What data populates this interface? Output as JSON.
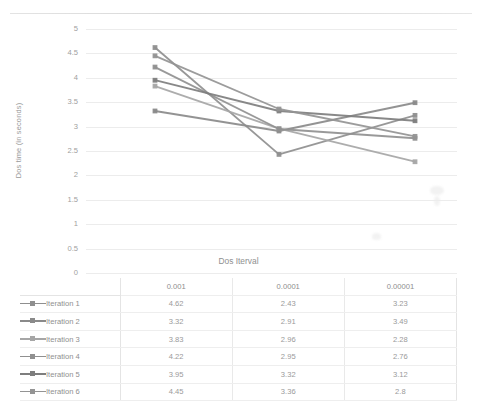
{
  "chart_data": {
    "type": "line",
    "title": "",
    "xlabel": "Dos Iterval",
    "ylabel": "Dos time (in seconds)",
    "categories": [
      "0.001",
      "0.0001",
      "0.00001"
    ],
    "ylim": [
      0,
      5
    ],
    "yticks": [
      "5",
      "4.5",
      "4",
      "3.5",
      "3",
      "2.5",
      "2",
      "1.5",
      "1",
      "0.5",
      "0"
    ],
    "grid": true,
    "legend_position": "table-left",
    "series": [
      {
        "name": "Iteration 1",
        "values": [
          4.62,
          2.43,
          3.23
        ],
        "color": "#8f8f8f"
      },
      {
        "name": "Iteration 2",
        "values": [
          3.32,
          2.91,
          3.49
        ],
        "color": "#8a8a8a"
      },
      {
        "name": "Iteration 3",
        "values": [
          3.83,
          2.96,
          2.28
        ],
        "color": "#a6a6a6"
      },
      {
        "name": "Iteration 4",
        "values": [
          4.22,
          2.95,
          2.76
        ],
        "color": "#909090"
      },
      {
        "name": "Iteration 5",
        "values": [
          3.95,
          3.32,
          3.12
        ],
        "color": "#7e7e7e"
      },
      {
        "name": "Iteration 6",
        "values": [
          4.45,
          3.36,
          2.8
        ],
        "color": "#949494"
      }
    ]
  },
  "table": {
    "header": [
      "",
      "0.001",
      "0.0001",
      "0.00001"
    ],
    "rows": [
      {
        "label": "Iteration 1",
        "values": [
          "4.62",
          "2.43",
          "3.23"
        ]
      },
      {
        "label": "Iteration 2",
        "values": [
          "3.32",
          "2.91",
          "3.49"
        ]
      },
      {
        "label": "Iteration 3",
        "values": [
          "3.83",
          "2.96",
          "2.28"
        ]
      },
      {
        "label": "Iteration 4",
        "values": [
          "4.22",
          "2.95",
          "2.76"
        ]
      },
      {
        "label": "Iteration 5",
        "values": [
          "3.95",
          "3.32",
          "3.12"
        ]
      },
      {
        "label": "Iteration 6",
        "values": [
          "4.45",
          "3.36",
          "2.8"
        ]
      }
    ]
  }
}
